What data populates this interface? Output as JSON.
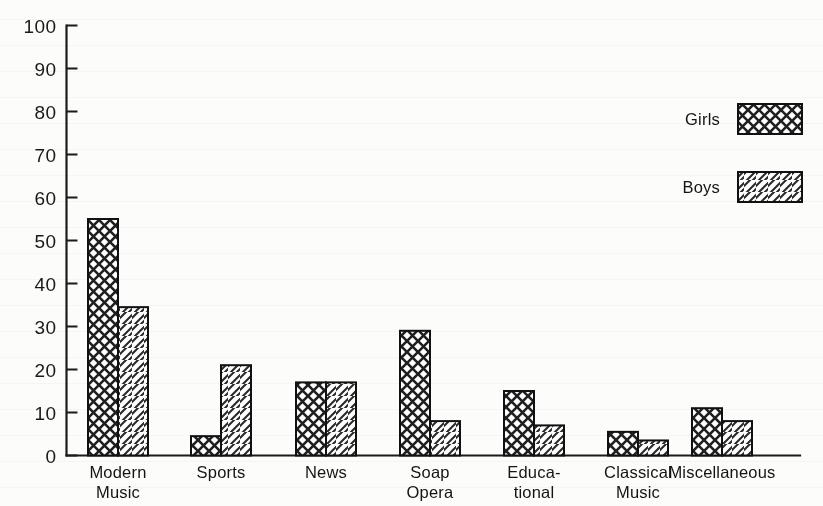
{
  "chart_data": {
    "type": "bar",
    "title": "",
    "subtitle": "",
    "xlabel": "",
    "ylabel": "",
    "categories": [
      "Modern Music",
      "Sports",
      "News",
      "Soap Opera",
      "Educational",
      "Classical Music",
      "Miscellaneous"
    ],
    "category_lines": [
      [
        "Modern",
        "Music"
      ],
      [
        "Sports",
        ""
      ],
      [
        "News",
        ""
      ],
      [
        "Soap",
        "Opera"
      ],
      [
        "Educa-",
        "tional"
      ],
      [
        "Classical",
        "Music"
      ],
      [
        "Miscellaneous",
        ""
      ]
    ],
    "series": [
      {
        "name": "Girls",
        "pattern": "crosshatch",
        "values": [
          55,
          4.5,
          17,
          29,
          15,
          5.5,
          11
        ]
      },
      {
        "name": "Boys",
        "pattern": "diagonal-hatch",
        "values": [
          34.5,
          21,
          17,
          8,
          7,
          3.5,
          8
        ]
      }
    ],
    "ylim": [
      0,
      100
    ],
    "yticks": [
      0,
      10,
      20,
      30,
      40,
      50,
      60,
      70,
      80,
      90,
      100
    ],
    "ytick_labels": [
      "0",
      "10",
      "20",
      "30",
      "40",
      "50",
      "60",
      "70",
      "80",
      "90",
      "100"
    ],
    "grid": false,
    "legend_position": "top-right",
    "legend": [
      {
        "label": "Girls",
        "pattern": "crosshatch"
      },
      {
        "label": "Boys",
        "pattern": "diagonal-hatch"
      }
    ],
    "colors": {
      "axis": "#1b1b1b",
      "bar_outline": "#111111",
      "bar_fill": "#ffffff",
      "hatch": "#222222",
      "background": "#fcfcfb",
      "text": "#141414"
    }
  }
}
